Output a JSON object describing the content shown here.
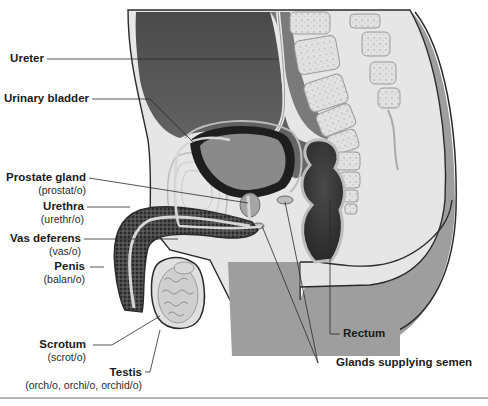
{
  "diagram": {
    "colors": {
      "background": "#ffffff",
      "abdomen_cavity": "#5a5a5a",
      "tissue_light": "#e4e4e4",
      "body_mid": "#9a9a9a",
      "outline": "#2a2a2a",
      "bladder_wall": "#1e1e1e",
      "spongy": "#3a3a3a",
      "divider": "#b5b5b5"
    },
    "labels": [
      {
        "id": "ureter",
        "name": "Ureter",
        "root": ""
      },
      {
        "id": "urinary-bladder",
        "name": "Urinary bladder",
        "root": ""
      },
      {
        "id": "prostate-gland",
        "name": "Prostate gland",
        "root": "(prostat/o)"
      },
      {
        "id": "urethra",
        "name": "Urethra",
        "root": "(urethr/o)"
      },
      {
        "id": "vas-deferens",
        "name": "Vas deferens",
        "root": "(vas/o)"
      },
      {
        "id": "penis",
        "name": "Penis",
        "root": "(balan/o)"
      },
      {
        "id": "scrotum",
        "name": "Scrotum",
        "root": "(scrot/o)"
      },
      {
        "id": "testis",
        "name": "Testis",
        "root": "(orch/o, orchi/o, orchid/o)"
      },
      {
        "id": "rectum",
        "name": "Rectum",
        "root": ""
      },
      {
        "id": "glands-supplying-semen",
        "name": "Glands supplying semen",
        "root": ""
      }
    ]
  }
}
